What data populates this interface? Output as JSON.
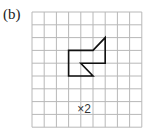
{
  "figure": {
    "label": "(b)",
    "scale_factor_text": "×2"
  },
  "grid": {
    "columns": 9,
    "rows": 9,
    "origin_px": [
      32,
      12
    ],
    "cell_w": 12.2,
    "cell_h": 12.8,
    "line_color": "#b8b8b8"
  },
  "shape": {
    "description": "Closed polygon drawn on square grid",
    "vertices_grid": [
      [
        3,
        3
      ],
      [
        5,
        3
      ],
      [
        6,
        2
      ],
      [
        6,
        4
      ],
      [
        4,
        4
      ],
      [
        5,
        5
      ],
      [
        3,
        5
      ]
    ],
    "stroke_color": "#111111"
  }
}
